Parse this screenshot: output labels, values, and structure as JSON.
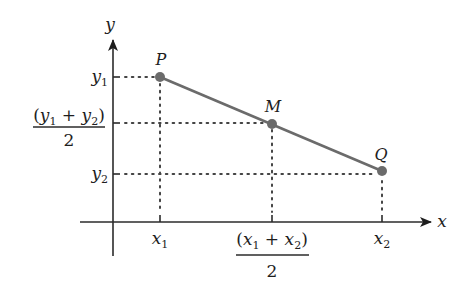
{
  "diagram": {
    "colors": {
      "segment": "#6b6b6b",
      "points": "#6b6b6b",
      "axes": "#2b2b2b",
      "text": "#1e1e1e"
    },
    "axes": {
      "x_label": "x",
      "y_label": "y"
    },
    "points": [
      {
        "name": "P",
        "label": "P",
        "x": "x1",
        "y": "y1"
      },
      {
        "name": "M",
        "label": "M",
        "x": "(x1 + x2)/2",
        "y": "(y1 + y2)/2"
      },
      {
        "name": "Q",
        "label": "Q",
        "x": "x2",
        "y": "y2"
      }
    ],
    "y_ticks": {
      "y1": {
        "var": "y",
        "sub": "1"
      },
      "mid": {
        "open": "(",
        "var1": "y",
        "sub1": "1",
        "plus": " + ",
        "var2": "y",
        "sub2": "2",
        "close": ")",
        "denominator": "2"
      },
      "y2": {
        "var": "y",
        "sub": "2"
      }
    },
    "x_ticks": {
      "x1": {
        "var": "x",
        "sub": "1"
      },
      "mid": {
        "open": "(",
        "var1": "x",
        "sub1": "1",
        "plus": " + ",
        "var2": "x",
        "sub2": "2",
        "close": ")",
        "denominator": "2"
      },
      "x2": {
        "var": "x",
        "sub": "2"
      }
    }
  }
}
